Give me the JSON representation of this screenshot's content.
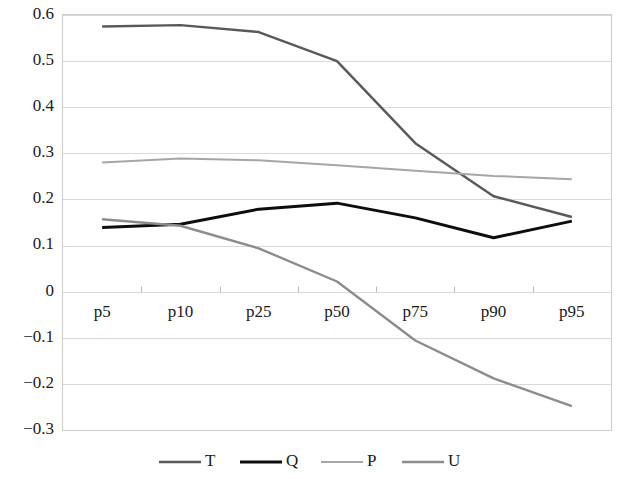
{
  "chart_data": {
    "type": "line",
    "title": "",
    "subtitle": "",
    "xlabel": "",
    "ylabel": "",
    "categories": [
      "p5",
      "p10",
      "p25",
      "p50",
      "p75",
      "p90",
      "p95"
    ],
    "ylim": [
      -0.3,
      0.6
    ],
    "y_ticks": [
      0.6,
      0.5,
      0.4,
      0.3,
      0.2,
      0.1,
      0,
      -0.1,
      -0.2,
      -0.3
    ],
    "y_tick_labels": [
      "0.6",
      "0.5",
      "0.4",
      "0.3",
      "0.2",
      "0.1",
      "0",
      "−0.1",
      "−0.2",
      "−0.3"
    ],
    "grid": true,
    "legend_position": "bottom",
    "series": [
      {
        "name": "T",
        "color": "#595959",
        "width": 2.4,
        "values": [
          0.575,
          0.578,
          0.563,
          0.5,
          0.322,
          0.207,
          0.162
        ]
      },
      {
        "name": "Q",
        "color": "#0d0d0d",
        "width": 3.0,
        "values": [
          0.139,
          0.146,
          0.179,
          0.192,
          0.16,
          0.117,
          0.153
        ]
      },
      {
        "name": "P",
        "color": "#a6a6a6",
        "width": 2.0,
        "values": [
          0.28,
          0.289,
          0.285,
          0.274,
          0.262,
          0.251,
          0.244
        ]
      },
      {
        "name": "U",
        "color": "#8c8c8c",
        "width": 2.4,
        "values": [
          0.157,
          0.143,
          0.094,
          0.022,
          -0.106,
          -0.188,
          -0.248
        ]
      }
    ]
  },
  "legend": {
    "items": [
      {
        "label": "T",
        "color": "#595959",
        "width": 2.4
      },
      {
        "label": "Q",
        "color": "#0d0d0d",
        "width": 3.0
      },
      {
        "label": "P",
        "color": "#a6a6a6",
        "width": 2.0
      },
      {
        "label": "U",
        "color": "#8c8c8c",
        "width": 2.4
      }
    ]
  },
  "colors": {
    "background": "#ffffff",
    "gridline": "#d9d9d9",
    "border": "#d0d0d0",
    "text": "#1a1a1a"
  }
}
